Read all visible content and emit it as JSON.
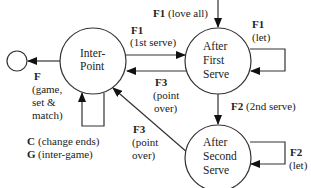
{
  "diagram": {
    "type": "state-transition",
    "nodes": [
      {
        "id": "terminal",
        "lines": []
      },
      {
        "id": "inter-point",
        "lines": [
          "Inter-",
          "Point"
        ]
      },
      {
        "id": "after-first-serve",
        "lines": [
          "After",
          "First",
          "Serve"
        ]
      },
      {
        "id": "after-second-serve",
        "lines": [
          "After",
          "Second",
          "Serve"
        ]
      }
    ],
    "edges": {
      "entry": {
        "key": "F1",
        "desc": "(love all)"
      },
      "first_serve": {
        "key": "F1",
        "desc": "(1st serve)"
      },
      "first_let": {
        "key": "F1",
        "desc": "(let)"
      },
      "first_point_over": {
        "key": "F3",
        "desc1": "(point",
        "desc2": "over)"
      },
      "second_serve": {
        "key": "F2",
        "desc": "(2nd serve)"
      },
      "second_let": {
        "key": "F2",
        "desc": "(let)"
      },
      "second_point_over": {
        "key": "F3",
        "desc1": "(point",
        "desc2": "over)"
      },
      "game_set_match": {
        "key": "F",
        "desc1": "(game,",
        "desc2": "set &",
        "desc3": "match)"
      },
      "inter_loop": {
        "c_key": "C",
        "c_desc": "(change ends)",
        "g_key": "G",
        "g_desc": "(inter-game)"
      }
    }
  }
}
